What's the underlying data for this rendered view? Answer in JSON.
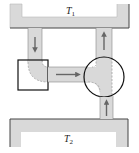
{
  "diagram": {
    "tanks": [
      {
        "id": "T1",
        "label": "T",
        "subscript": "1",
        "position": "top"
      },
      {
        "id": "T2",
        "label": "T",
        "subscript": "2",
        "position": "bottom"
      }
    ],
    "pipes": [
      {
        "id": "left-down-pipe",
        "flow": "down"
      },
      {
        "id": "horizontal-pipe",
        "flow": "right"
      },
      {
        "id": "right-upper-pipe",
        "flow": "up"
      },
      {
        "id": "right-lower-pipe",
        "flow": "up"
      }
    ],
    "highlights": [
      {
        "shape": "square",
        "encloses": "elbow-junction"
      },
      {
        "shape": "circle",
        "encloses": "tee-junction"
      }
    ],
    "colors": {
      "fill": "#d9d9d9",
      "outline": "#444444",
      "arrow": "#666666",
      "highlight": "#111111"
    }
  }
}
